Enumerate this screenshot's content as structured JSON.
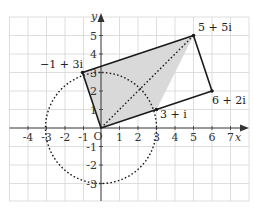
{
  "diagram": {
    "axes": {
      "x_label": "x",
      "y_label": "y",
      "origin_label": "O",
      "x_ticks": [
        "-4",
        "-3",
        "-2",
        "-1",
        "1",
        "2",
        "3",
        "4",
        "5",
        "6",
        "7"
      ],
      "y_ticks": [
        "5",
        "4",
        "3",
        "2",
        "1",
        "-1",
        "-2",
        "-3"
      ],
      "x_range": [
        -5,
        8
      ],
      "y_range": [
        -4,
        6
      ]
    },
    "points": [
      {
        "name": "origin",
        "value": [
          0,
          0
        ],
        "label": "O"
      },
      {
        "name": "p1",
        "value": [
          3,
          1
        ],
        "label": "3 + i"
      },
      {
        "name": "p2",
        "value": [
          5,
          5
        ],
        "label": "5 + 5i"
      },
      {
        "name": "p3",
        "value": [
          -1,
          3
        ],
        "label": "−1 + 3i"
      },
      {
        "name": "p4",
        "value": [
          6,
          2
        ],
        "label": "6 + 2i"
      }
    ],
    "labels": {
      "p1": "3 + i",
      "p2": "5 + 5i",
      "p3": "−1 + 3i",
      "p4": "6 + 2i"
    },
    "shapes": {
      "shaded_square": "O, 3+i, 5+5i, -1+3i",
      "outer_rectangle": "O, 6+2i, 5+5i, -1+3i",
      "diagonal": "O to 5+5i (dotted)",
      "circle": "center O, radius 3 (dotted)"
    },
    "colors": {
      "grid": "#d6d6d6",
      "axis": "#333333",
      "fill": "#d9d9d9",
      "line": "#1a1a1a"
    }
  }
}
